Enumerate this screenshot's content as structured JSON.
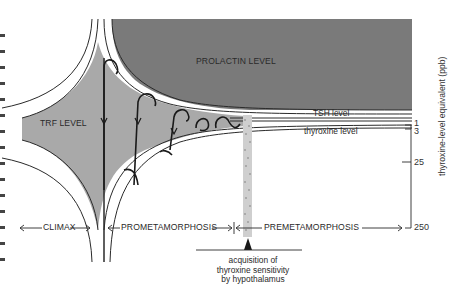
{
  "diagram": {
    "regions": {
      "prolactin": "PROLACTIN LEVEL",
      "trf": "TRF LEVEL"
    },
    "curves": {
      "tsh": "TSH level",
      "thyroxine": "thyroxine level"
    },
    "stages": {
      "climax": "CLIMAX",
      "prometamorphosis": "PROMETAMORPHOSIS",
      "premetamorphosis": "PREMETAMORPHOSIS"
    },
    "axis": {
      "label": "thyroxine-level equivalent (ppb)",
      "ticks": [
        "1",
        "3",
        "25",
        "250"
      ]
    },
    "event": {
      "line1": "acquisition of",
      "line2": "thyroxine sensitivity",
      "line3": "by hypothalamus"
    },
    "colors": {
      "prolactin_fill": "#7a7a7a",
      "trf_fill": "#a9a9a9",
      "line": "#2a2a2a",
      "background": "#ffffff"
    }
  }
}
